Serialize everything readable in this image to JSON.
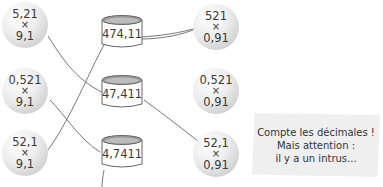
{
  "left_balls": [
    {
      "top": "5,21",
      "op": "×",
      "bottom": "9,1"
    },
    {
      "top": "0,521",
      "op": "×",
      "bottom": "9,1"
    },
    {
      "top": "52,1",
      "op": "×",
      "bottom": "9,1"
    }
  ],
  "cans": [
    {
      "value": "474,11"
    },
    {
      "value": "47,411"
    },
    {
      "value": "4,7411"
    }
  ],
  "right_balls": [
    {
      "top": "521",
      "op": "×",
      "bottom": "0,91"
    },
    {
      "top": "0,521",
      "op": "×",
      "bottom": "0,91"
    },
    {
      "top": "52,1",
      "op": "×",
      "bottom": "0,91"
    }
  ],
  "note": {
    "line1": "Compte les décimales !",
    "line2": "Mais attention :",
    "line3": "il y a un intrus..."
  },
  "colors": {
    "string": "#6e6e6e",
    "ball": "#dcdcdc",
    "note_bg": "#efefef"
  }
}
